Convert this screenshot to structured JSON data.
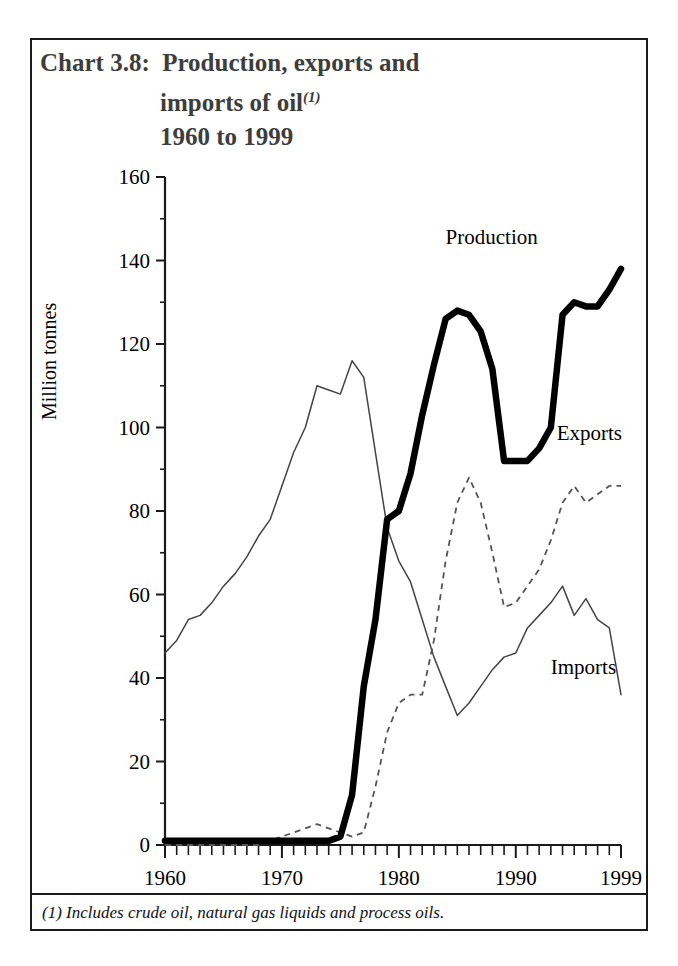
{
  "title": {
    "line1": "Chart 3.8:  Production, exports and",
    "line2": "imports of oil",
    "line2_superscript": "(1)",
    "line3": "1960 to 1999"
  },
  "footnote": "(1) Includes crude oil, natural gas liquids and process oils.",
  "axis": {
    "ylabel": "Million tonnes",
    "y_ticks": [
      "0",
      "20",
      "40",
      "60",
      "80",
      "100",
      "120",
      "140",
      "160"
    ],
    "x_ticks": [
      "1960",
      "1970",
      "1980",
      "1990",
      "1999"
    ]
  },
  "series_labels": {
    "production": "Production",
    "exports": "Exports",
    "imports": "Imports"
  },
  "colors": {
    "production": "#000000",
    "exports": "#555555",
    "imports": "#444444",
    "axis": "#1a1a1a",
    "title": "#3d3d3d",
    "background": "#ffffff"
  },
  "chart_data": {
    "type": "line",
    "title": "Chart 3.8: Production, exports and imports of oil(1) 1960 to 1999",
    "xlabel": "",
    "ylabel": "Million tonnes",
    "xlim": [
      1960,
      1999
    ],
    "ylim": [
      0,
      160
    ],
    "y_major_step": 20,
    "y_minor_step": 10,
    "x_tick_step": 1,
    "x_labeled_ticks": [
      1960,
      1970,
      1980,
      1990,
      1999
    ],
    "grid": false,
    "legend": "inline-annotations",
    "annotations": [
      {
        "text": "Production",
        "x": 1984.0,
        "y": 144
      },
      {
        "text": "Exports",
        "x": 1993.5,
        "y": 97
      },
      {
        "text": "Imports",
        "x": 1993.0,
        "y": 41
      }
    ],
    "x": [
      1960,
      1961,
      1962,
      1963,
      1964,
      1965,
      1966,
      1967,
      1968,
      1969,
      1970,
      1971,
      1972,
      1973,
      1974,
      1975,
      1976,
      1977,
      1978,
      1979,
      1980,
      1981,
      1982,
      1983,
      1984,
      1985,
      1986,
      1987,
      1988,
      1989,
      1990,
      1991,
      1992,
      1993,
      1994,
      1995,
      1996,
      1997,
      1998,
      1999
    ],
    "series": [
      {
        "name": "Production",
        "style": "solid-thick",
        "values": [
          1,
          1,
          1,
          1,
          1,
          1,
          1,
          1,
          1,
          1,
          1,
          1,
          1,
          1,
          1,
          2,
          12,
          38,
          54,
          78,
          80,
          89,
          103,
          115,
          126,
          128,
          127,
          123,
          114,
          92,
          92,
          92,
          95,
          100,
          127,
          130,
          129,
          129,
          133,
          138
        ]
      },
      {
        "name": "Exports",
        "style": "dashed",
        "values": [
          0,
          0,
          0,
          0,
          0,
          0,
          0,
          0,
          0,
          1,
          2,
          3,
          4,
          5,
          4,
          3,
          2,
          3,
          14,
          27,
          34,
          36,
          36,
          49,
          68,
          82,
          88,
          82,
          70,
          57,
          58,
          62,
          66,
          73,
          82,
          86,
          82,
          84,
          86,
          86
        ]
      },
      {
        "name": "Imports",
        "style": "solid-thin",
        "values": [
          46,
          49,
          54,
          55,
          58,
          62,
          65,
          69,
          74,
          78,
          86,
          94,
          100,
          110,
          109,
          108,
          116,
          112,
          94,
          76,
          68,
          63,
          54,
          45,
          38,
          31,
          34,
          38,
          42,
          45,
          46,
          52,
          55,
          58,
          62,
          55,
          59,
          54,
          52,
          36
        ]
      }
    ]
  }
}
